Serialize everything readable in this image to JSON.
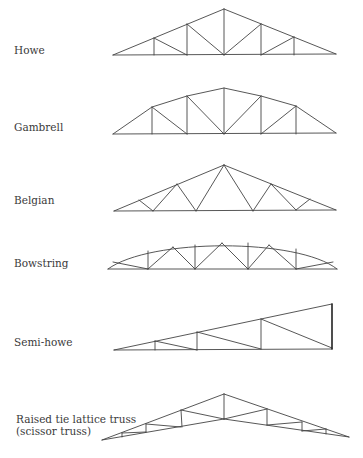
{
  "trusses": [
    {
      "name": "Howe",
      "label_y": 44,
      "lines": [
        [
          113,
          55,
          224,
          9
        ],
        [
          224,
          9,
          336,
          54
        ],
        [
          113,
          55,
          336,
          54
        ],
        [
          154,
          38,
          154,
          55
        ],
        [
          187,
          24,
          187,
          55
        ],
        [
          224,
          9,
          224,
          55
        ],
        [
          261,
          24,
          261,
          55
        ],
        [
          294,
          37,
          294,
          55
        ],
        [
          154,
          38,
          187,
          55
        ],
        [
          187,
          24,
          224,
          55
        ],
        [
          224,
          55,
          261,
          24
        ],
        [
          261,
          55,
          294,
          37
        ]
      ]
    },
    {
      "name": "Gambrell",
      "label_y": 121,
      "polyline": [
        [
          113,
          134
        ],
        [
          152,
          107
        ],
        [
          187,
          96
        ],
        [
          224,
          88
        ],
        [
          261,
          96
        ],
        [
          296,
          106
        ],
        [
          336,
          133
        ]
      ],
      "lines": [
        [
          113,
          134,
          336,
          133
        ],
        [
          152,
          107,
          152,
          134
        ],
        [
          187,
          96,
          187,
          134
        ],
        [
          224,
          88,
          224,
          134
        ],
        [
          261,
          96,
          261,
          134
        ],
        [
          296,
          106,
          296,
          134
        ],
        [
          152,
          107,
          187,
          134
        ],
        [
          187,
          96,
          224,
          134
        ],
        [
          224,
          134,
          261,
          96
        ],
        [
          261,
          134,
          296,
          106
        ]
      ]
    },
    {
      "name": "Belgian",
      "label_y": 194,
      "lines": [
        [
          114,
          211,
          224,
          165
        ],
        [
          224,
          165,
          336,
          210
        ],
        [
          114,
          211,
          336,
          210
        ],
        [
          139,
          200,
          153,
          211
        ],
        [
          153,
          211,
          177,
          184
        ],
        [
          177,
          184,
          196,
          211
        ],
        [
          196,
          211,
          224,
          165
        ],
        [
          224,
          165,
          253,
          211
        ],
        [
          253,
          211,
          271,
          184
        ],
        [
          271,
          184,
          296,
          210
        ],
        [
          296,
          210,
          310,
          199
        ]
      ]
    },
    {
      "name": "Bowstring",
      "label_y": 257,
      "arc": "M108,269 C150,238 298,238 337,269",
      "lines": [
        [
          108,
          269,
          337,
          269
        ],
        [
          113,
          262,
          148,
          269
        ],
        [
          148,
          251,
          148,
          269
        ],
        [
          148,
          269,
          173,
          247
        ],
        [
          173,
          247,
          195,
          269
        ],
        [
          195,
          245,
          195,
          269
        ],
        [
          195,
          269,
          222,
          243
        ],
        [
          222,
          243,
          248,
          269
        ],
        [
          248,
          243,
          248,
          269
        ],
        [
          248,
          269,
          269,
          245
        ],
        [
          269,
          245,
          296,
          269
        ],
        [
          296,
          249,
          296,
          269
        ],
        [
          296,
          269,
          333,
          262
        ]
      ]
    },
    {
      "name": "Semi-howe",
      "label_y": 336,
      "lines": [
        [
          114,
          350,
          332,
          304
        ],
        [
          114,
          350,
          332,
          349
        ],
        [
          155,
          341,
          155,
          350
        ],
        [
          197,
          332,
          197,
          350
        ],
        [
          261,
          319,
          261,
          349
        ],
        [
          155,
          341,
          197,
          350
        ],
        [
          197,
          332,
          261,
          349
        ],
        [
          261,
          319,
          332,
          348
        ]
      ],
      "heavy": [
        [
          332,
          304,
          332,
          349
        ]
      ]
    },
    {
      "name": "Raised tie lattice truss\n(scissor truss)",
      "label_lines": [
        "Raised tie lattice truss",
        "(scissor truss)"
      ],
      "label_y": 413,
      "lines": [
        [
          102,
          440,
          224,
          394
        ],
        [
          224,
          394,
          349,
          437
        ],
        [
          102,
          440,
          224,
          419
        ],
        [
          224,
          419,
          349,
          437
        ],
        [
          224,
          394,
          224,
          419
        ],
        [
          122,
          433,
          122,
          437
        ],
        [
          122,
          433,
          146,
          432
        ],
        [
          146,
          424,
          146,
          432
        ],
        [
          146,
          424,
          181,
          427
        ],
        [
          181,
          410,
          182,
          427
        ],
        [
          181,
          410,
          224,
          419
        ],
        [
          224,
          419,
          267,
          409
        ],
        [
          267,
          409,
          267,
          425
        ],
        [
          267,
          425,
          302,
          422
        ],
        [
          302,
          422,
          302,
          431
        ],
        [
          302,
          431,
          326,
          429
        ],
        [
          326,
          429,
          326,
          434
        ]
      ]
    }
  ]
}
